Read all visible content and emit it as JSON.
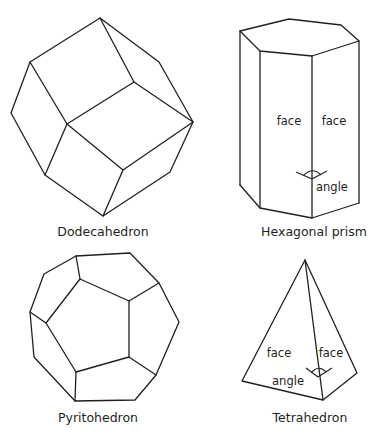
{
  "figures": [
    {
      "id": "dodecahedron",
      "caption": "Dodecahedron",
      "annotations": []
    },
    {
      "id": "hexagonal-prism",
      "caption": "Hexagonal prism",
      "annotations": {
        "face_left": "face",
        "face_right": "face",
        "angle": "angle"
      }
    },
    {
      "id": "pyritohedron",
      "caption": "Pyritohedron",
      "annotations": []
    },
    {
      "id": "tetrahedron",
      "caption": "Tetrahedron",
      "annotations": {
        "face_left": "face",
        "face_right": "face",
        "angle": "angle"
      }
    }
  ],
  "colors": {
    "line": "#231f20",
    "background": "#ffffff"
  }
}
